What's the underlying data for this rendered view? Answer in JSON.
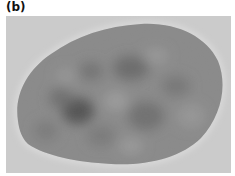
{
  "panel": {
    "label": "(b)",
    "description": "Grayscale micrograph of an oval cell nucleus with mottled chromatin",
    "colors": {
      "background": "#cbcbcb",
      "halo": "#dedede",
      "nucleus": "#8a8a8a",
      "dark_chromatin": "#555555"
    }
  }
}
